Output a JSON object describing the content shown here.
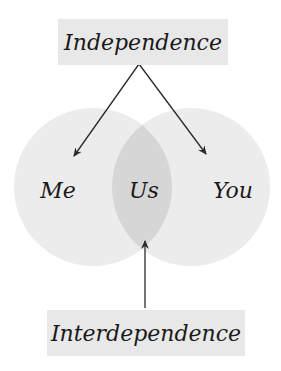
{
  "diagram": {
    "top_label": "Independence",
    "bottom_label": "Interdependence",
    "circles": [
      {
        "label": "Me"
      },
      {
        "label": "You"
      }
    ],
    "intersection_label": "Us",
    "colors": {
      "box_fill": "#e8e8e8",
      "circle_fill": "#ececec",
      "intersection_fill": "#d6d6d6",
      "arrow": "#2a2a2a",
      "text": "#1a1a1a"
    }
  }
}
